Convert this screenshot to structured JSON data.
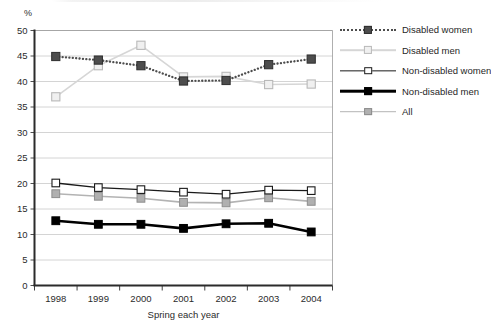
{
  "chart_data": {
    "type": "line",
    "title": "",
    "xlabel": "Spring each year",
    "ylabel": "%",
    "categories": [
      "1998",
      "1999",
      "2000",
      "2001",
      "2002",
      "2003",
      "2004"
    ],
    "x": [
      1998,
      1999,
      2000,
      2001,
      2002,
      2003,
      2004
    ],
    "ylim": [
      0,
      50
    ],
    "yticks": [
      0,
      5,
      10,
      15,
      20,
      25,
      30,
      35,
      40,
      45,
      50
    ],
    "grid": "horizontal",
    "legend_position": "right",
    "series": [
      {
        "name": "Disabled women",
        "values": [
          44.9,
          44.2,
          43.1,
          40.1,
          40.2,
          43.3,
          44.4
        ],
        "color": "#4d4d4d",
        "line_style": "dotted",
        "marker": "filled-square"
      },
      {
        "name": "Disabled men",
        "values": [
          37.0,
          43.1,
          47.1,
          40.9,
          41.0,
          39.4,
          39.5
        ],
        "color": "#d6d6d6",
        "line_style": "solid",
        "marker": "open-square"
      },
      {
        "name": "Non-disabled women",
        "values": [
          20.1,
          19.2,
          18.8,
          18.3,
          17.9,
          18.7,
          18.6
        ],
        "color": "#1a1a1a",
        "line_style": "solid-thin",
        "marker": "white-square"
      },
      {
        "name": "Non-disabled men",
        "values": [
          12.7,
          12.0,
          12.0,
          11.2,
          12.1,
          12.2,
          10.5
        ],
        "color": "#000000",
        "line_style": "solid-thick",
        "marker": "black-square"
      },
      {
        "name": "All",
        "values": [
          18.0,
          17.5,
          17.1,
          16.3,
          16.2,
          17.2,
          16.5
        ],
        "color": "#b3b3b3",
        "line_style": "solid",
        "marker": "grey-square"
      }
    ]
  },
  "legend": {
    "items": [
      {
        "label": "Disabled women"
      },
      {
        "label": "Disabled men"
      },
      {
        "label": "Non-disabled women"
      },
      {
        "label": "Non-disabled men"
      },
      {
        "label": "All"
      }
    ]
  },
  "axes": {
    "y_unit_label": "%",
    "x_axis_title": "Spring each year"
  }
}
